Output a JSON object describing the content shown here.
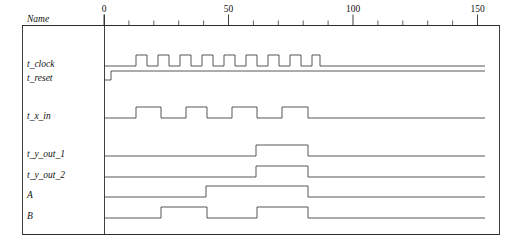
{
  "window": {
    "title": "Simulation Timing Waveform"
  },
  "header": {
    "name_column_label": "Name"
  },
  "axis": {
    "unit": "ns",
    "labels": [
      "0",
      "50",
      "100",
      "150"
    ],
    "label_values": [
      0,
      50,
      100,
      150
    ],
    "major_tick_step": 50,
    "minor_tick_step": 10,
    "range_start": 0,
    "range_end": 155,
    "px_origin": 104,
    "px_per_unit": 2.49
  },
  "colors": {
    "background": "#ffffff",
    "wave_stroke": "#3a3a3a",
    "frame_stroke": "#2a2a2a",
    "text": "#111111"
  },
  "signals": [
    {
      "name": "t_clock",
      "label": "t_clock",
      "row_baseline_px": 66,
      "amplitude_px": 11,
      "initial": 0,
      "transitions_px": [
        136,
        147,
        158,
        169,
        180,
        191,
        202,
        213,
        224,
        235,
        246,
        257,
        268,
        279,
        290,
        301,
        312,
        320
      ],
      "final": 0,
      "description": "free running clock, 10 pulses"
    },
    {
      "name": "t_reset",
      "label": "t_reset",
      "row_baseline_px": 80,
      "amplitude_px": 9,
      "initial": 0,
      "transitions_px": [
        111
      ],
      "final": 1,
      "description": "reset deasserted high shortly after time 0"
    },
    {
      "name": "t_x_in",
      "label": "t_x_in",
      "row_baseline_px": 118,
      "amplitude_px": 11,
      "initial": 0,
      "transitions_px": [
        136,
        161,
        186,
        207,
        232,
        257,
        282,
        308
      ],
      "final": 0,
      "description": "input data stream"
    },
    {
      "name": "t_y_out_1",
      "label": "t_y_out_1",
      "row_baseline_px": 156,
      "amplitude_px": 11,
      "initial": 0,
      "transitions_px": [
        256,
        308
      ],
      "final": 0,
      "description": "output 1 single wide pulse"
    },
    {
      "name": "t_y_out_2",
      "label": "t_y_out_2",
      "row_baseline_px": 177,
      "amplitude_px": 11,
      "initial": 0,
      "transitions_px": [
        256,
        308
      ],
      "final": 0,
      "description": "output 2 single wide pulse"
    },
    {
      "name": "A",
      "label": "A",
      "row_baseline_px": 197,
      "amplitude_px": 11,
      "initial": 0,
      "transitions_px": [
        206,
        308
      ],
      "final": 0,
      "description": "internal state A"
    },
    {
      "name": "B",
      "label": "B",
      "row_baseline_px": 218,
      "amplitude_px": 11,
      "initial": 0,
      "transitions_px": [
        161,
        207,
        257,
        308
      ],
      "final": 0,
      "description": "internal state B, two pulses"
    }
  ],
  "chart_data": {
    "type": "line",
    "xlabel": "time (ns)",
    "ylabel": "",
    "xlim": [
      0,
      155
    ],
    "x_tick_labels": [
      "0",
      "50",
      "100",
      "150"
    ],
    "x_tick_values": [
      0,
      50,
      100,
      150
    ],
    "minor_tick_step": 10,
    "grid": false,
    "legend": "none",
    "series": [
      {
        "name": "t_clock",
        "type": "digital",
        "initial_level": 0,
        "edges_time": [
          12.9,
          17.3,
          21.7,
          26.1,
          30.5,
          34.9,
          39.4,
          43.8,
          48.2,
          52.6,
          57.0,
          61.4,
          65.9,
          70.3,
          74.7,
          79.1,
          83.5,
          86.7
        ],
        "final_level": 0
      },
      {
        "name": "t_reset",
        "type": "digital",
        "initial_level": 0,
        "edges_time": [
          2.8
        ],
        "final_level": 1
      },
      {
        "name": "t_x_in",
        "type": "digital",
        "initial_level": 0,
        "edges_time": [
          12.9,
          22.9,
          32.9,
          41.4,
          51.4,
          61.4,
          71.5,
          81.9
        ],
        "final_level": 0
      },
      {
        "name": "t_y_out_1",
        "type": "digital",
        "initial_level": 0,
        "edges_time": [
          61.0,
          81.9
        ],
        "final_level": 0
      },
      {
        "name": "t_y_out_2",
        "type": "digital",
        "initial_level": 0,
        "edges_time": [
          61.0,
          81.9
        ],
        "final_level": 0
      },
      {
        "name": "A",
        "type": "digital",
        "initial_level": 0,
        "edges_time": [
          41.0,
          81.9
        ],
        "final_level": 0
      },
      {
        "name": "B",
        "type": "digital",
        "initial_level": 0,
        "edges_time": [
          22.9,
          41.4,
          61.4,
          81.9
        ],
        "final_level": 0
      }
    ]
  }
}
